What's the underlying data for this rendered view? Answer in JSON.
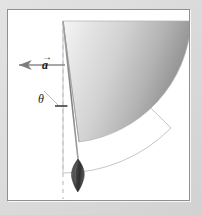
{
  "figure": {
    "type": "physics-vector-diagram",
    "frame": {
      "background_color": "#ffffff",
      "border_color": "#8e9093",
      "outer_background_color": "#d9d9d9"
    },
    "labels": {
      "acceleration_vector": "a",
      "acceleration_vector_accent": "→",
      "angle": "θ"
    },
    "colors": {
      "sector_fill_light": "#f2f2f2",
      "sector_fill_dark": "#8d8d8d",
      "outline": "#9a9a9a",
      "rod": "#8c8c8c",
      "bob": "#3a3a3a",
      "arrow": "#7d7d7d",
      "dashed_line": "#bdbdbd",
      "angle_mark": "#4a4a4a",
      "leader_line": "#a8a8a8"
    },
    "geometry": {
      "pivot": {
        "x": 55,
        "y": 11
      },
      "rod_angle_deg": 12,
      "rod_length": 160,
      "bob_center": {
        "x": 70,
        "y": 168
      },
      "sector_radius": 128,
      "sector_start_deg": 0,
      "sector_end_deg": 78,
      "outer_arc_radius": 152,
      "arrow_start": {
        "x": 57,
        "y": 55
      },
      "arrow_end": {
        "x": 10,
        "y": 55
      },
      "angle_mark": {
        "x": 53,
        "y": 96,
        "width": 12
      },
      "dashed_line": {
        "x": 55,
        "y_start": 11,
        "y_end": 191
      }
    }
  }
}
